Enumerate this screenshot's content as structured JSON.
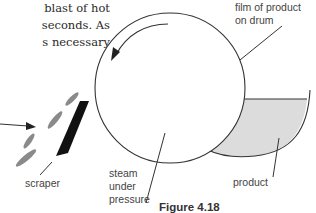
{
  "body_text": {
    "lines": [
      "blast of hot",
      "seconds. As",
      "s necessary"
    ]
  },
  "diagram": {
    "labels": {
      "film": [
        "film of product",
        "on drum"
      ],
      "scraper": "scraper",
      "steam": [
        "steam",
        "under",
        "pressure"
      ],
      "product": "product"
    },
    "caption": "Figure 4.18",
    "colors": {
      "stroke": "#333333",
      "product_fill": "#dcdcdc",
      "flakes": "#8a8a8a",
      "scraper": "#111111"
    }
  }
}
